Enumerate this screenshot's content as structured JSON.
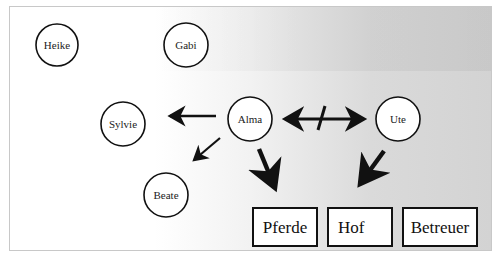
{
  "diagram": {
    "nodes": [
      {
        "id": "heike",
        "label": "Heike",
        "cx": 57,
        "cy": 45,
        "r": 21
      },
      {
        "id": "gabi",
        "label": "Gabi",
        "cx": 186,
        "cy": 45,
        "r": 22
      },
      {
        "id": "sylvie",
        "label": "Sylvie",
        "cx": 123,
        "cy": 124,
        "r": 22
      },
      {
        "id": "alma",
        "label": "Alma",
        "cx": 250,
        "cy": 119,
        "r": 22
      },
      {
        "id": "ute",
        "label": "Ute",
        "cx": 398,
        "cy": 119,
        "r": 22
      },
      {
        "id": "beate",
        "label": "Beate",
        "cx": 166,
        "cy": 195,
        "r": 22
      }
    ],
    "boxes": [
      {
        "id": "pferde",
        "label": "Pferde"
      },
      {
        "id": "hof",
        "label": "Hof"
      },
      {
        "id": "betreuer",
        "label": "Betreuer"
      }
    ],
    "edges": [
      {
        "from": "alma",
        "to": "sylvie",
        "style": "medium"
      },
      {
        "from": "alma",
        "to": "beate",
        "style": "thin"
      },
      {
        "from": "alma",
        "to": "ute",
        "style": "bidirectional-crossed"
      },
      {
        "from": "alma",
        "to": "pferde",
        "style": "thick"
      },
      {
        "from": "ute",
        "to": "hof",
        "style": "thick"
      }
    ]
  }
}
